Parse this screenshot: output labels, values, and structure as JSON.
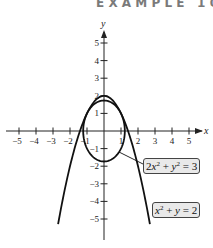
{
  "header": {
    "title": "EXAMPLE 10"
  },
  "axes": {
    "x_label": "x",
    "y_label": "y",
    "x_ticks": [
      -5,
      -4,
      -3,
      -2,
      -1,
      1,
      2,
      3,
      4,
      5
    ],
    "y_ticks": [
      5,
      4,
      3,
      2,
      1,
      -1,
      -2,
      -3,
      -4,
      -5
    ],
    "x_range": [
      -5.7,
      5.7
    ],
    "y_range": [
      -6,
      6
    ]
  },
  "curves": [
    {
      "name": "ellipse",
      "equation": "2x^2 + y^2 = 3",
      "color": "#111111"
    },
    {
      "name": "parabola",
      "equation": "x^2 + y = 2",
      "color": "#111111"
    }
  ],
  "labels": {
    "ellipse": {
      "lhs_a": "2",
      "var_x": "x",
      "exp": "2",
      "plus": " + ",
      "var_y": "y",
      "exp2": "2",
      "rhs": " = 3"
    },
    "parabola": {
      "var_x": "x",
      "exp": "2",
      "plus": " + ",
      "var_y": "y",
      "rhs": " = 2"
    }
  },
  "colors": {
    "label_bg": "#e9e9e9",
    "header": "#7a7a7a",
    "stroke": "#111111"
  }
}
